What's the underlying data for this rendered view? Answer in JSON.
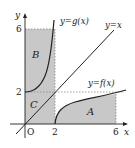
{
  "diagram": {
    "axes": {
      "x_label": "x",
      "y_label": "y",
      "origin_label": "O",
      "x_ticks": [
        "2",
        "6"
      ],
      "y_ticks": [
        "2",
        "6"
      ]
    },
    "curves": [
      {
        "id": "g",
        "label": "y=g(x)"
      },
      {
        "id": "identity",
        "label": "y=x"
      },
      {
        "id": "f",
        "label": "y=f(x)"
      }
    ],
    "regions": [
      {
        "id": "A",
        "label": "A"
      },
      {
        "id": "B",
        "label": "B"
      },
      {
        "id": "C",
        "label": "C"
      }
    ],
    "colors": {
      "shade": "#c8c8c8",
      "line": "#222222",
      "dashed": "#888888"
    }
  }
}
